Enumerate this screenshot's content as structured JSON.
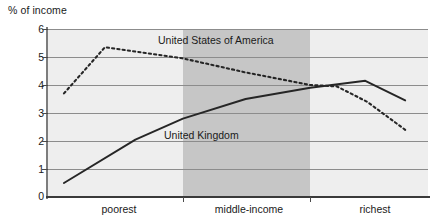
{
  "axis": {
    "y_title": "% of income",
    "y_ticks": [
      "6",
      "5",
      "4",
      "3",
      "2",
      "1",
      "0"
    ],
    "x_ticks": [
      "poorest",
      "middle-income",
      "richest"
    ]
  },
  "series_labels": {
    "usa": "United States of America",
    "uk": "United Kingdom"
  },
  "chart_data": {
    "type": "line",
    "title": "",
    "subtitle": "",
    "xlabel": "",
    "ylabel": "% of income",
    "ylim": [
      0,
      6
    ],
    "ytick_values": [
      0,
      1,
      2,
      3,
      4,
      5,
      6
    ],
    "xtick_labels": [
      "poorest",
      "middle-income",
      "richest"
    ],
    "xlim": [
      0,
      10
    ],
    "grid": "horizontal",
    "legend": "inline-annotations",
    "shaded_bands": [
      {
        "label": "poorest",
        "x_start": 0,
        "x_end": 3.55,
        "color": "#eeeeee"
      },
      {
        "label": "middle-income",
        "x_start": 3.55,
        "x_end": 6.9,
        "color": "#c6c6c6"
      },
      {
        "label": "richest",
        "x_start": 6.9,
        "x_end": 10,
        "color": "#eeeeee"
      }
    ],
    "series": [
      {
        "name": "United States of America",
        "style": "dotted",
        "color": "#262626",
        "x": [
          0.42,
          1.5,
          3.55,
          5.2,
          6.9,
          7.6,
          8.4,
          9.4
        ],
        "values": [
          3.7,
          5.35,
          4.95,
          4.45,
          4.0,
          3.95,
          3.4,
          2.4
        ]
      },
      {
        "name": "United Kingdom",
        "style": "solid",
        "color": "#262626",
        "x": [
          0.42,
          2.3,
          3.55,
          5.2,
          6.9,
          8.35,
          9.4
        ],
        "values": [
          0.5,
          2.05,
          2.8,
          3.5,
          3.9,
          4.15,
          3.45
        ]
      }
    ]
  }
}
